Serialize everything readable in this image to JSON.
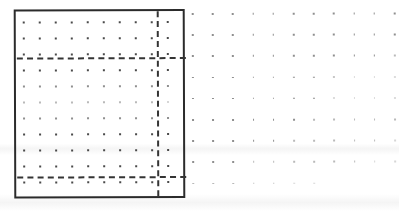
{
  "document": {
    "title": "Dot Grid Worksheet Scan",
    "description": "Scanned dot-grid sheet with a solid rectangular frame and dashed construction guide lines",
    "background_color": "#ffffff",
    "ink_color": "#2b2b2b",
    "dot_color": "#4a4a4a",
    "guide_color": "#343434"
  },
  "frame_box": {
    "label": "solid-rectangle-frame",
    "left": 14,
    "top": 9,
    "width": 171,
    "height": 189,
    "border_width": 2,
    "border_style": "solid",
    "color": "#2b2b2b"
  },
  "inner_grid": {
    "label": "fine-dot-grid-inside-box",
    "origin_x": 23,
    "origin_y": 21,
    "spacing_x": 16,
    "spacing_y": 16,
    "columns": 10,
    "rows": 11,
    "dot_size": 1.6,
    "color": "#4a4a4a"
  },
  "outer_grid": {
    "label": "coarse-dot-grid-right-margin",
    "origin_x": 192,
    "origin_y": 13,
    "spacing_x": 20.2,
    "spacing_y": 21.2,
    "columns": 11,
    "rows": 9,
    "dot_size": 1.6,
    "color": "#6e6e6e",
    "fade_note": "dots fade toward lower-right; final row is partial"
  },
  "guides": {
    "horizontal": [
      {
        "name": "upper-dashed-guide",
        "y": 57,
        "x_start": 17,
        "x_end": 186,
        "style": "dashed",
        "width": 2
      },
      {
        "name": "lower-dashed-guide",
        "y": 176,
        "x_start": 17,
        "x_end": 186,
        "style": "dashed",
        "width": 2
      }
    ],
    "vertical": [
      {
        "name": "right-dashed-guide",
        "x": 157,
        "y_start": 11,
        "y_end": 196,
        "style": "dashed",
        "width": 2
      }
    ]
  },
  "regions": {
    "top_band_label": "band above upper guide",
    "middle_band_label": "band between guides",
    "bottom_band_label": "band below lower guide",
    "right_column_label": "column right of vertical guide"
  }
}
